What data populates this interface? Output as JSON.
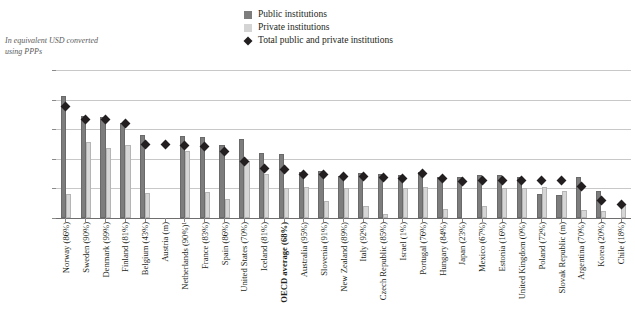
{
  "axis_note": "In equivalent USD converted using PPPs",
  "legend": {
    "items": [
      {
        "label": "Public institutions",
        "icon": "square-filled-dark-icon",
        "color": "#7d7d7d"
      },
      {
        "label": "Private institutions",
        "icon": "square-filled-light-icon",
        "color": "#d4d4d4"
      },
      {
        "label": "Total public and private institutions",
        "icon": "diamond-marker-icon",
        "color": "#231f20"
      }
    ]
  },
  "chart_data": {
    "type": "bar",
    "title": "",
    "subtitle": "In equivalent USD converted using PPPs",
    "xlabel": "",
    "ylabel": "",
    "ylim": [
      0,
      25000
    ],
    "yticks": [
      0,
      5000,
      10000,
      15000,
      20000,
      25000
    ],
    "ytick_labels": [
      "0",
      "5 000",
      "10 000",
      "15 000",
      "20 000",
      "25 000"
    ],
    "grid": true,
    "legend_position": "top-center",
    "categories": [
      "Norway (86%)",
      "Sweden (90%)",
      "Denmark (99%)",
      "Finland (81%)",
      "Belgium (43%)",
      "Austria (m)",
      "Netherlands (90%)¹",
      "France (83%)",
      "Spain (86%)",
      "United States (70%)",
      "Iceland (81%)",
      "OECD average (68%)",
      "Australia (95%)",
      "Slovenia (91%)",
      "New Zealand (89%)",
      "Italy (92%)",
      "Czech Republic (85%)",
      "Israel (1%)",
      "Portugal (76%)",
      "Hungary (84%)",
      "Japan (23%)",
      "Mexico (67%)",
      "Estonia (16%)",
      "United Kingdom (0%)",
      "Poland (72%)",
      "Slovak Republic (m)",
      "Argentina (70%)",
      "Korea (20%)",
      "Chile (18%)"
    ],
    "series": [
      {
        "name": "Public institutions",
        "color": "#7d7d7d",
        "values": [
          20600,
          17200,
          17100,
          16000,
          14100,
          null,
          13800,
          13700,
          12300,
          13400,
          11000,
          10800,
          7700,
          7900,
          7100,
          7600,
          7400,
          7300,
          7800,
          6900,
          7000,
          7200,
          7300,
          7000,
          4000,
          3900,
          7000,
          4500,
          null
        ]
      },
      {
        "name": "Private institutions",
        "color": "#d4d4d4",
        "values": [
          4100,
          12800,
          11900,
          12400,
          4300,
          null,
          11300,
          4400,
          3200,
          9700,
          7400,
          5000,
          5200,
          2900,
          5100,
          2100,
          600,
          5100,
          5200,
          1600,
          null,
          2100,
          5000,
          5000,
          5200,
          4600,
          1300,
          1200,
          2200
        ]
      }
    ],
    "markers": {
      "name": "Total public and private institutions",
      "color": "#231f20",
      "values": [
        18900,
        16700,
        16700,
        16000,
        12500,
        12400,
        12300,
        12100,
        11200,
        9500,
        8400,
        8200,
        7400,
        7300,
        7000,
        7000,
        6800,
        6700,
        7600,
        6600,
        6200,
        6400,
        6300,
        6400,
        6400,
        6400,
        5400,
        3000,
        2200
      ]
    }
  }
}
